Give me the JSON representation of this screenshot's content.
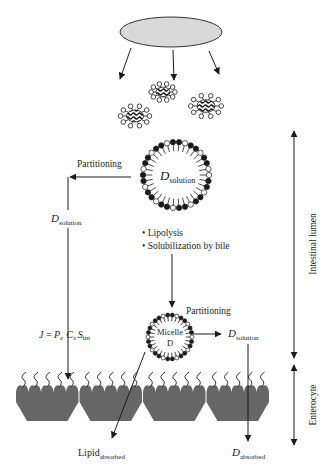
{
  "diagram": {
    "type": "lipid-based drug delivery / absorption schematic",
    "colors": {
      "ink": "#1a1a1a",
      "droplet_fill": "#d9d9d9",
      "cell_fill": "#666666",
      "text": "#222222"
    },
    "labels": {
      "partitioning_left": "Partitioning",
      "partitioning_micelle": "Partitioning",
      "d_solution_vesicle_main": "D",
      "d_solution_vesicle_sub": "solution",
      "d_solution_left_main": "D",
      "d_solution_left_sub": "solution",
      "d_solution_right_main": "D",
      "d_solution_right_sub": "solution",
      "bullet_1": "• Lipolysis",
      "bullet_2": "• Solubilization by bile",
      "micelle_line1": "Micelle",
      "micelle_line2": "D",
      "flux_eq_J": "J",
      "flux_eq_eq": " = ",
      "flux_eq_P": "P",
      "flux_eq_P_sub": "e",
      "flux_eq_C": "C",
      "flux_eq_C_sub": "s",
      "flux_eq_S": "S",
      "flux_eq_S_sub": "int",
      "lipid_absorbed_main": "Lipid",
      "lipid_absorbed_sub": "absorbed",
      "d_absorbed_main": "D",
      "d_absorbed_sub": "absorbed",
      "region_lumen": "Intestinal lumen",
      "region_enterocyte": "Enterocyte"
    },
    "regions": [
      {
        "name": "Intestinal lumen",
        "y_start": 130,
        "y_end": 358
      },
      {
        "name": "Enterocyte",
        "y_start": 364,
        "y_end": 445
      }
    ],
    "elements": {
      "lipid_droplet": {
        "cx": 171,
        "cy": 32,
        "rx": 51,
        "ry": 15
      },
      "small_micelles": [
        {
          "cx": 135,
          "cy": 116,
          "r": 17
        },
        {
          "cx": 163,
          "cy": 92,
          "r": 14
        },
        {
          "cx": 206,
          "cy": 106,
          "r": 18
        }
      ],
      "vesicle": {
        "cx": 176,
        "cy": 175,
        "r": 33
      },
      "mixed_micelle": {
        "cx": 170,
        "cy": 337,
        "r": 22
      },
      "enterocyte_cells": 4
    }
  }
}
